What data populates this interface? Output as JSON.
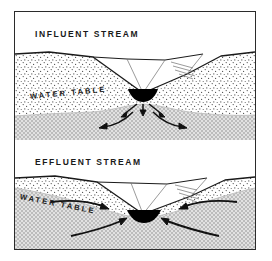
{
  "figure": {
    "border_color": "#2b2b2b",
    "background_color": "#ffffff"
  },
  "panels": [
    {
      "id": "influent",
      "caption": "INFLUENT  STREAM",
      "water_table_label": "WATER  TABLE",
      "description": "Stream channel above water table; water seeps downward from the stream into the ground",
      "flow_direction": "away from stream (downward and outward)",
      "arrow_count": 5,
      "water_table_shape": "mound beneath the stream",
      "stream_symbol_color": "#000000",
      "unsaturated_zone_fill": "#ffffff stipple",
      "saturated_zone_fill": "#d0d0d0"
    },
    {
      "id": "effluent",
      "caption": "EFFLUENT  STREAM",
      "water_table_label": "WATER  TABLE",
      "description": "Water table above stream bed; groundwater discharges into the stream",
      "flow_direction": "toward stream (inward and upward)",
      "arrow_count": 4,
      "water_table_shape": "sloping down toward the stream",
      "stream_symbol_color": "#000000",
      "unsaturated_zone_fill": "#ffffff stipple",
      "saturated_zone_fill": "#d0d0d0"
    }
  ],
  "legend_colors": {
    "saturated_zone": "#d0d0d0",
    "line": "#2b2b2b",
    "stream": "#000000",
    "text": "#1a1a1a"
  }
}
